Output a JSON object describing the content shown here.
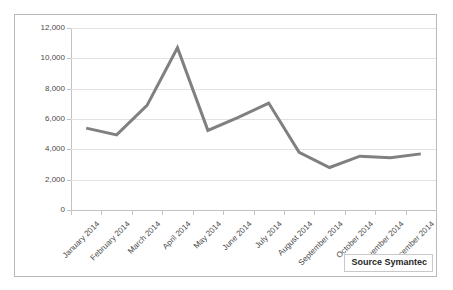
{
  "chart_data": {
    "type": "line",
    "title": "",
    "subtitle": "",
    "xlabel": "",
    "ylabel": "",
    "categories": [
      "January 2014",
      "February 2014",
      "March 2014",
      "April 2014",
      "May 2014",
      "June 2014",
      "July 2014",
      "August 2014",
      "September 2014",
      "October 2014",
      "November 2014",
      "December 2014"
    ],
    "values": [
      5400,
      4950,
      6900,
      10700,
      5250,
      6100,
      7050,
      3800,
      2800,
      3550,
      3450,
      3700
    ],
    "series": [
      {
        "name": "",
        "values": [
          5400,
          4950,
          6900,
          10700,
          5250,
          6100,
          7050,
          3800,
          2800,
          3550,
          3450,
          3700
        ]
      }
    ],
    "ylim": [
      0,
      12000
    ],
    "y_ticks": [
      0,
      2000,
      4000,
      6000,
      8000,
      10000,
      12000
    ],
    "y_tick_labels": [
      "0",
      "2,000",
      "4,000",
      "6,000",
      "8,000",
      "10,000",
      "12,000"
    ],
    "grid": true,
    "legend": "none",
    "line_color": "#808080",
    "grid_color": "#e2e2e2",
    "axis_color": "#c2c2c2"
  },
  "annotations": {
    "source_label": "Source Symantec"
  }
}
